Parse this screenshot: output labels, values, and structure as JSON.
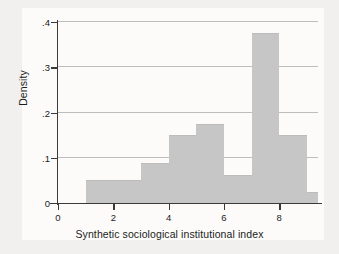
{
  "chart_data": {
    "type": "bar",
    "title": "",
    "subtitle": "",
    "xlabel": "Synthetic sociological institutional index",
    "ylabel": "Density",
    "xlim": [
      0,
      9.4
    ],
    "ylim": [
      0,
      0.4
    ],
    "grid": "horizontal",
    "legend": "none",
    "bin_width": 1,
    "bar_color": "#c6c6c6",
    "axis_color": "#3a3a3a",
    "grid_color": "#bdbdbd",
    "background_color": "#f2f0ee",
    "plot_background_color": "#fcfbfa",
    "xticks": [
      {
        "value": 0,
        "label": "0"
      },
      {
        "value": 2,
        "label": "2"
      },
      {
        "value": 4,
        "label": "4"
      },
      {
        "value": 6,
        "label": "6"
      },
      {
        "value": 8,
        "label": "8"
      }
    ],
    "yticks": [
      {
        "value": 0,
        "label": "0"
      },
      {
        "value": 0.1,
        "label": ".1"
      },
      {
        "value": 0.2,
        "label": ".2"
      },
      {
        "value": 0.3,
        "label": ".3"
      },
      {
        "value": 0.4,
        "label": ".4"
      }
    ],
    "bins": [
      {
        "x0": 1,
        "x1": 2,
        "value": 0.05
      },
      {
        "x0": 2,
        "x1": 3,
        "value": 0.05
      },
      {
        "x0": 3,
        "x1": 4,
        "value": 0.0875
      },
      {
        "x0": 4,
        "x1": 5,
        "value": 0.15
      },
      {
        "x0": 5,
        "x1": 6,
        "value": 0.175
      },
      {
        "x0": 6,
        "x1": 7,
        "value": 0.0625
      },
      {
        "x0": 7,
        "x1": 8,
        "value": 0.375
      },
      {
        "x0": 8,
        "x1": 9,
        "value": 0.15
      },
      {
        "x0": 9,
        "x1": 9.4,
        "value": 0.025
      }
    ],
    "categories": [
      "1-2",
      "2-3",
      "3-4",
      "4-5",
      "5-6",
      "6-7",
      "7-8",
      "8-9",
      "9-9.4"
    ],
    "values": [
      0.05,
      0.05,
      0.0875,
      0.15,
      0.175,
      0.0625,
      0.375,
      0.15,
      0.025
    ]
  }
}
